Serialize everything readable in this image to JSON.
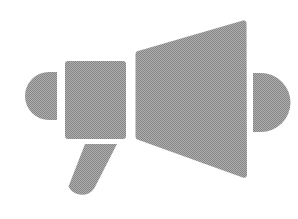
{
  "canvas": {
    "width": 298,
    "height": 219,
    "background_color": "#ffffff"
  },
  "icon": {
    "name": "megaphone-icon",
    "label": "Megaphone",
    "fill_color": "#9a9a9a",
    "fill_style": "dithered-halftone-gray",
    "dither_light": "#b4b4b4",
    "dither_dark": "#828282",
    "parts": [
      {
        "name": "left-end-cap",
        "shape": "half-disc",
        "orientation": "flat-edge-right",
        "x": 33,
        "y": 72,
        "width": 24,
        "height": 48
      },
      {
        "name": "speaker-body",
        "shape": "rounded-rectangle",
        "x": 65,
        "y": 61,
        "width": 61,
        "height": 78,
        "corner_radius": 3
      },
      {
        "name": "horn-cone",
        "shape": "trapezoid",
        "points": "135,50 245,18 246,178 135,140",
        "corner_radius": 4
      },
      {
        "name": "right-end-cap",
        "shape": "half-disc",
        "orientation": "flat-edge-left",
        "x": 253,
        "y": 73,
        "width": 30,
        "height": 59
      },
      {
        "name": "grip-handle",
        "shape": "angled-rounded-bar",
        "points": "85,144 117,144 88,199 65,190",
        "corner_radius": 11
      }
    ]
  }
}
